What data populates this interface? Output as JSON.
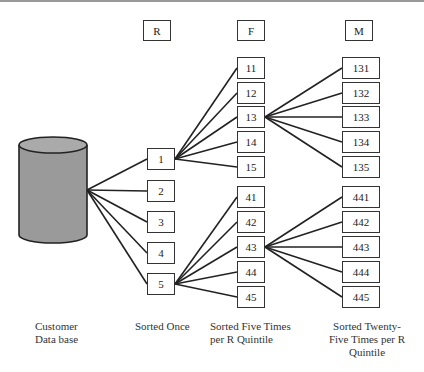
{
  "headers": {
    "r": "R",
    "f": "F",
    "m": "M"
  },
  "r_boxes": [
    "1",
    "2",
    "3",
    "4",
    "5"
  ],
  "f_boxes_top": [
    "11",
    "12",
    "13",
    "14",
    "15"
  ],
  "f_boxes_bottom": [
    "41",
    "42",
    "43",
    "44",
    "45"
  ],
  "m_boxes_top": [
    "131",
    "132",
    "133",
    "134",
    "135"
  ],
  "m_boxes_bottom": [
    "441",
    "442",
    "443",
    "444",
    "445"
  ],
  "captions": {
    "database": [
      "Customer",
      "Data base"
    ],
    "r": [
      "Sorted Once"
    ],
    "f": [
      "Sorted Five Times",
      "per R Quintile"
    ],
    "m": [
      "Sorted Twenty-",
      "Five Times per R",
      "Quintile"
    ]
  },
  "colors": {
    "cylinder": "#999999",
    "line": "#222222"
  }
}
